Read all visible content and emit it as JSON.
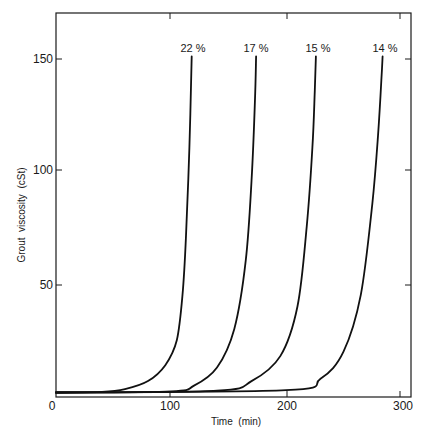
{
  "chart_data": {
    "type": "line",
    "title": "",
    "xlabel": "Time  (min)",
    "ylabel": "Grout  viscosity  (cSt)",
    "xlim": [
      0,
      310
    ],
    "ylim": [
      0,
      170
    ],
    "x_ticks": [
      "0",
      "100",
      "200",
      "300"
    ],
    "y_ticks": [
      "50",
      "100",
      "150"
    ],
    "grid": false,
    "legend": "inline labels at curve tops",
    "series": [
      {
        "name": "22%",
        "x": [
          0,
          40,
          60,
          80,
          95,
          105,
          110,
          113,
          116,
          118
        ],
        "y": [
          2,
          2.3,
          3.5,
          7,
          14,
          25,
          45,
          70,
          110,
          150
        ]
      },
      {
        "name": "17%",
        "x": [
          0,
          100,
          120,
          140,
          155,
          165,
          170,
          173,
          174
        ],
        "y": [
          2,
          2.5,
          5,
          13,
          30,
          60,
          95,
          130,
          150
        ]
      },
      {
        "name": "15%",
        "x": [
          0,
          140,
          170,
          195,
          210,
          218,
          223,
          225,
          226
        ],
        "y": [
          2,
          2.8,
          7,
          18,
          40,
          75,
          110,
          135,
          150
        ]
      },
      {
        "name": "14%",
        "x": [
          0,
          200,
          230,
          250,
          265,
          275,
          280,
          283,
          284
        ],
        "y": [
          2,
          3,
          8,
          20,
          45,
          85,
          115,
          140,
          150
        ]
      }
    ]
  },
  "labels": {
    "x_axis_title": "Time  (min)",
    "y_axis_title": "Grout  viscosity  (cSt)",
    "x_ticks": [
      "0",
      "100",
      "200",
      "300"
    ],
    "y_ticks": [
      "50",
      "100",
      "150"
    ],
    "curve_labels": [
      "22 %",
      "17 %",
      "15 %",
      "14 %"
    ]
  }
}
